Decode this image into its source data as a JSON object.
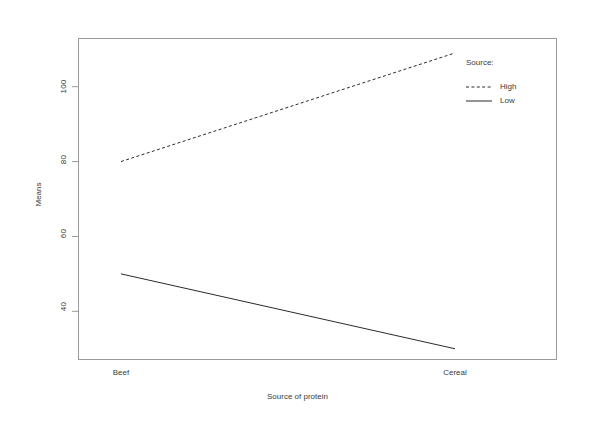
{
  "chart_data": {
    "type": "line",
    "title": "",
    "subtitle": "",
    "xlabel": "Source of protein",
    "ylabel": "Means",
    "categories": [
      "Beef",
      "Cereal"
    ],
    "series": [
      {
        "name": "High",
        "values": [
          80,
          109
        ],
        "style": "dashed"
      },
      {
        "name": "Low",
        "values": [
          50,
          30
        ],
        "style": "solid"
      }
    ],
    "legend": {
      "title": "Source:",
      "position": "right",
      "entries": [
        "High",
        "Low"
      ]
    },
    "yticks": [
      40,
      60,
      80,
      100
    ],
    "ytick_labels": [
      "40",
      "60",
      "80",
      "100"
    ],
    "xtick_labels": [
      "Beef",
      "Cereal"
    ],
    "ylim": [
      27,
      113
    ],
    "xlim": [
      0,
      1
    ],
    "grid": false,
    "frame": true,
    "colors": {
      "line": "#2b2b2b",
      "frame": "#9a9a9a",
      "text": "#3a3a3a",
      "background": "#ffffff"
    }
  }
}
